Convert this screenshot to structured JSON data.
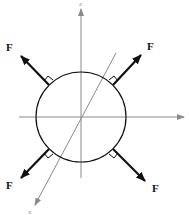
{
  "diagram": {
    "colors": {
      "background": "#ffffff",
      "axis": "#8a8a8a",
      "circle": "#111111",
      "force": "#111111",
      "label": "#111111"
    },
    "axes": {
      "vertical_label": "z",
      "diagonal_label": "x"
    },
    "forces": [
      {
        "id": "upper-left",
        "label": "F"
      },
      {
        "id": "upper-right",
        "label": "F"
      },
      {
        "id": "lower-left",
        "label": "F"
      },
      {
        "id": "lower-right",
        "label": "F"
      }
    ]
  }
}
